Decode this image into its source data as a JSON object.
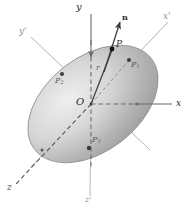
{
  "figure": {
    "type": "vector-diagram",
    "background_color": "#ffffff",
    "body": {
      "name": "ellipsoid",
      "fill_light": "#f2f2f2",
      "fill_mid": "#c9c9c9",
      "fill_dark": "#9a9a9a",
      "outline_color": "#8c8c8c",
      "center_x": 93,
      "center_y": 104,
      "semi_major": 74,
      "semi_minor": 47,
      "tilt_degrees": -38
    },
    "axes": [
      {
        "id": "y",
        "label": "y",
        "style": "solid-dashed",
        "color": "#6a6a6a",
        "label_x": 76,
        "label_y": 2,
        "label_size": 10
      },
      {
        "id": "x",
        "label": "x",
        "style": "solid",
        "color": "#6a6a6a",
        "label_x": 176,
        "label_y": 104,
        "label_size": 9
      },
      {
        "id": "z",
        "label": "z",
        "style": "dashed",
        "color": "#555555",
        "label_x": 8,
        "label_y": 188,
        "label_size": 9
      },
      {
        "id": "xp",
        "label": "x'",
        "style": "solid",
        "color": "#b3b3b3",
        "label_x": 163,
        "label_y": 16,
        "label_size": 9
      },
      {
        "id": "yp",
        "label": "y'",
        "style": "solid",
        "color": "#b3b3b3",
        "label_x": 20,
        "label_y": 31,
        "label_size": 9
      },
      {
        "id": "zp",
        "label": "z'",
        "style": "solid",
        "color": "#b3b3b3",
        "label_x": 85,
        "label_y": 198,
        "label_size": 8
      }
    ],
    "origin": {
      "label": "O",
      "x": 91,
      "y": 104,
      "label_x": 77,
      "label_y": 98,
      "label_size": 10
    },
    "vectors": [
      {
        "id": "n",
        "label": "n",
        "from_x": 93,
        "from_y": 104,
        "to_x": 120,
        "to_y": 20,
        "color": "#4a4a4a",
        "label_x": 122,
        "label_y": 17,
        "label_size": 8,
        "arrow": true
      },
      {
        "id": "r",
        "label": "r",
        "from_x": 93,
        "from_y": 104,
        "to_x": 112,
        "to_y": 49,
        "color": "#4a4a4a",
        "label_x": 96,
        "label_y": 68,
        "label_size": 8,
        "arrow": false
      }
    ],
    "points": [
      {
        "id": "P",
        "label": "P",
        "x": 112,
        "y": 49,
        "label_x": 116,
        "label_y": 44,
        "label_size": 9,
        "dot_r": 2.4,
        "color": "#1a1a1a"
      },
      {
        "id": "P1",
        "label": "P",
        "sub": "1",
        "x": 129,
        "y": 60,
        "label_x": 131,
        "label_y": 63,
        "label_size": 8,
        "dot_r": 2.0,
        "color": "#3d3d3d"
      },
      {
        "id": "P2",
        "label": "P",
        "sub": "2",
        "x": 62,
        "y": 74,
        "label_x": 56,
        "label_y": 79,
        "label_size": 8,
        "dot_r": 2.0,
        "color": "#3d3d3d"
      },
      {
        "id": "P3",
        "label": "P",
        "sub": "3",
        "x": 89,
        "y": 148,
        "label_x": 92,
        "label_y": 140,
        "label_size": 8,
        "dot_r": 2.2,
        "color": "#3d3d3d"
      }
    ]
  }
}
